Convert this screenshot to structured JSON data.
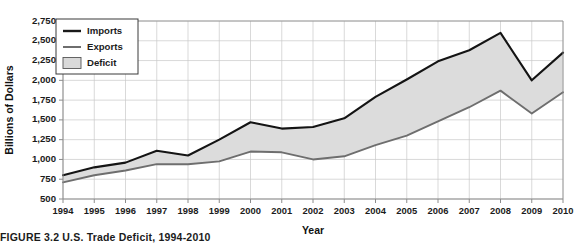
{
  "figure": {
    "caption_label": "FIGURE 3.2",
    "caption_title": "U.S. Trade Deficit, 1994-2010"
  },
  "legend": {
    "position": "top-left",
    "items": [
      {
        "label": "Imports",
        "marker": "line",
        "color": "#1a1a1a"
      },
      {
        "label": "Exports",
        "marker": "line",
        "color": "#6e6e6e"
      },
      {
        "label": "Deficit",
        "marker": "swatch",
        "color": "#d9d9d9"
      }
    ]
  },
  "colors": {
    "imports_line": "#141414",
    "exports_line": "#6e6e6e",
    "deficit_fill": "#dcdcdc",
    "gridline": "#c8c8c8",
    "axis": "#8c8c8c",
    "text": "#1b1b1b",
    "background": "#ffffff"
  },
  "chart_data": {
    "type": "area",
    "title": "U.S. Trade Deficit, 1994-2010",
    "xlabel": "Year",
    "ylabel": "Billions of Dollars",
    "xlim": [
      1994,
      2010
    ],
    "ylim": [
      500,
      2750
    ],
    "grid": true,
    "legend_position": "top-left",
    "x": [
      1994,
      1995,
      1996,
      1997,
      1998,
      1999,
      2000,
      2001,
      2002,
      2003,
      2004,
      2005,
      2006,
      2007,
      2008,
      2009,
      2010
    ],
    "categories": [
      "1994",
      "1995",
      "1996",
      "1997",
      "1998",
      "1999",
      "2000",
      "2001",
      "2002",
      "2003",
      "2004",
      "2005",
      "2006",
      "2007",
      "2008",
      "2009",
      "2010"
    ],
    "ytick_labels": [
      "500",
      "750",
      "1,000",
      "1,250",
      "1,500",
      "1,750",
      "2,000",
      "2,250",
      "2,500",
      "2,750"
    ],
    "ytick_values": [
      500,
      750,
      1000,
      1250,
      1500,
      1750,
      2000,
      2250,
      2500,
      2750
    ],
    "series": [
      {
        "name": "Imports",
        "color": "#141414",
        "values": [
          800,
          900,
          960,
          1110,
          1050,
          1250,
          1470,
          1390,
          1410,
          1520,
          1790,
          2010,
          2240,
          2380,
          2600,
          2000,
          2350
        ]
      },
      {
        "name": "Exports",
        "color": "#6e6e6e",
        "values": [
          710,
          800,
          860,
          940,
          940,
          975,
          1100,
          1090,
          1000,
          1040,
          1180,
          1300,
          1480,
          1660,
          1870,
          1580,
          1850
        ]
      }
    ],
    "fill_between": {
      "name": "Deficit",
      "upper_series": "Imports",
      "lower_series": "Exports",
      "color": "#dcdcdc"
    }
  }
}
